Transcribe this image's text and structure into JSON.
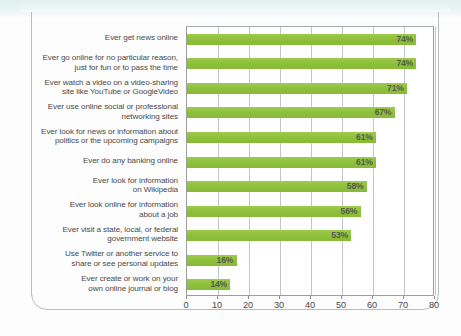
{
  "chart_data": {
    "type": "bar",
    "orientation": "horizontal",
    "title": "",
    "subtitle": "",
    "xlabel": "",
    "ylabel": "",
    "xlim": [
      0,
      80
    ],
    "xticks": [
      0,
      10,
      20,
      30,
      40,
      50,
      60,
      70,
      80
    ],
    "xtick_labels": [
      "0",
      "10",
      "20",
      "30",
      "40",
      "50",
      "60",
      "70",
      "80"
    ],
    "grid": "vertical",
    "legend": "none",
    "value_suffix": "%",
    "bar_color": "#8fc23e",
    "categories": [
      "Ever get news online",
      "Ever go online for no particular reason, just for fun or to pass the time",
      "Ever watch a video on a video-sharing site like YouTube or GoogleVideo",
      "Ever use online social or professional networking sites",
      "Ever look for news or information about politics or the upcoming campaigns",
      "Ever do any banking online",
      "Ever look for information on Wikipedia",
      "Ever look online for information about a job",
      "Ever visit a state, local, or federal government website",
      "Use Twitter or another service to share or see personal updates",
      "Ever create or work on your own online journal or blog"
    ],
    "category_lines": [
      [
        "Ever get news online",
        ""
      ],
      [
        "Ever go online for no particular reason,",
        "just for fun or to pass the time"
      ],
      [
        "Ever watch a video on a video-sharing",
        "site like YouTube or GoogleVideo"
      ],
      [
        "Ever use online social or professional",
        "networking sites"
      ],
      [
        "Ever look for news or information about",
        "politics or the upcoming campaigns"
      ],
      [
        "Ever do any banking online",
        ""
      ],
      [
        "Ever look for information",
        "on Wikipedia"
      ],
      [
        "Ever look online for information",
        "about a job"
      ],
      [
        "Ever visit a state, local, or federal",
        "government website"
      ],
      [
        "Use Twitter or another service to",
        "share or see personal updates"
      ],
      [
        "Ever create or work on your",
        "own online journal or blog"
      ]
    ],
    "values": [
      74,
      74,
      71,
      67,
      61,
      61,
      58,
      56,
      53,
      16,
      14
    ],
    "value_labels": [
      "74%",
      "74%",
      "71%",
      "67%",
      "61%",
      "61%",
      "58%",
      "56%",
      "53%",
      "16%",
      "14%"
    ]
  }
}
